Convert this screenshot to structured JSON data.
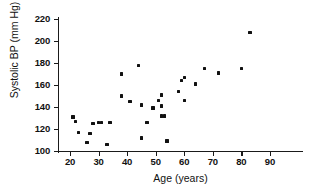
{
  "chart_data": {
    "type": "scatter",
    "title": "",
    "xlabel": "Age (years)",
    "ylabel": "Systolic BP (mm Hg)",
    "xlim": [
      18,
      92
    ],
    "ylim": [
      98,
      222
    ],
    "xticks": [
      20,
      30,
      40,
      50,
      60,
      70,
      80,
      90
    ],
    "yticks": [
      100,
      120,
      140,
      160,
      180,
      200,
      220
    ],
    "grid": false,
    "legend": null,
    "marker": "square",
    "marker_color": "#111111",
    "points": [
      {
        "x": 21,
        "y": 131
      },
      {
        "x": 22,
        "y": 127
      },
      {
        "x": 23,
        "y": 117
      },
      {
        "x": 26,
        "y": 108
      },
      {
        "x": 27,
        "y": 116
      },
      {
        "x": 28,
        "y": 125
      },
      {
        "x": 30,
        "y": 126
      },
      {
        "x": 31,
        "y": 126
      },
      {
        "x": 33,
        "y": 106
      },
      {
        "x": 34,
        "y": 126
      },
      {
        "x": 38,
        "y": 170
      },
      {
        "x": 38,
        "y": 150
      },
      {
        "x": 41,
        "y": 145
      },
      {
        "x": 44,
        "y": 178
      },
      {
        "x": 45,
        "y": 112
      },
      {
        "x": 45,
        "y": 142
      },
      {
        "x": 47,
        "y": 126
      },
      {
        "x": 49,
        "y": 139
      },
      {
        "x": 51,
        "y": 146
      },
      {
        "x": 52,
        "y": 141
      },
      {
        "x": 52,
        "y": 151
      },
      {
        "x": 52,
        "y": 132
      },
      {
        "x": 53,
        "y": 132
      },
      {
        "x": 54,
        "y": 109
      },
      {
        "x": 58,
        "y": 154
      },
      {
        "x": 59,
        "y": 164
      },
      {
        "x": 60,
        "y": 167
      },
      {
        "x": 60,
        "y": 146
      },
      {
        "x": 64,
        "y": 161
      },
      {
        "x": 67,
        "y": 175
      },
      {
        "x": 72,
        "y": 171
      },
      {
        "x": 80,
        "y": 175
      },
      {
        "x": 83,
        "y": 208
      }
    ]
  }
}
